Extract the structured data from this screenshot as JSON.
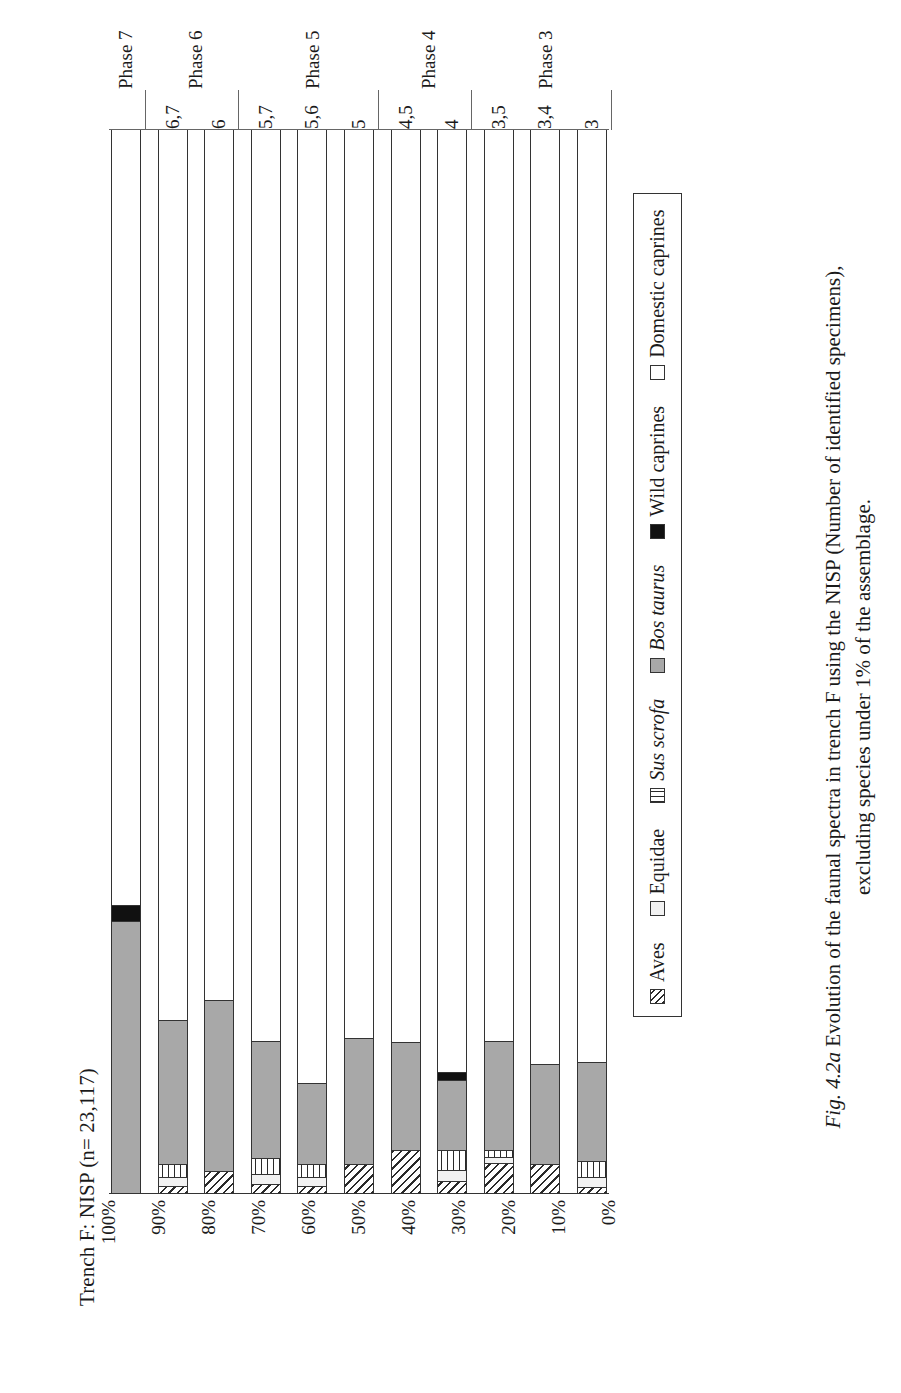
{
  "figure": {
    "caption_label": "Fig. 4.2a",
    "caption_line1": "Evolution of the faunal spectra in trench F using the NISP (Number of identified specimens),",
    "caption_line2": "excluding species under 1% of the assemblage."
  },
  "chart_data": {
    "type": "bar",
    "orientation": "stacked-100-rotated",
    "title": "Trench F: NISP (n= 23,117)",
    "xlabel": "",
    "ylabel": "",
    "ylim": [
      0,
      100
    ],
    "grid": false,
    "legend_position": "right-of-plot",
    "categories": [
      "3",
      "3,4",
      "3,5",
      "4",
      "4,5",
      "5",
      "5,6",
      "5,7",
      "6",
      "6,7",
      "Phase 7"
    ],
    "group_labels": [
      "Phase 3",
      "Phase 4",
      "Phase 5",
      "Phase 6",
      "Phase 7"
    ],
    "groups": [
      {
        "label": "Phase 3",
        "categories": [
          "3",
          "3,4",
          "3,5"
        ]
      },
      {
        "label": "Phase 4",
        "categories": [
          "4",
          "4,5"
        ]
      },
      {
        "label": "Phase 5",
        "categories": [
          "5",
          "5,6",
          "5,7"
        ]
      },
      {
        "label": "Phase 6",
        "categories": [
          "6",
          "6,7"
        ]
      },
      {
        "label": "Phase 7",
        "categories": [
          "Phase 7"
        ]
      }
    ],
    "tick_labels": [
      "100%",
      "90%",
      "80%",
      "70%",
      "60%",
      "50%",
      "40%",
      "30%",
      "20%",
      "10%",
      "0%"
    ],
    "series": [
      {
        "name": "Aves",
        "color": "#ffffff",
        "pattern": "diagonal-hatch",
        "values": [
          0.5,
          2.6,
          2.7,
          1.0,
          4.0,
          2.6,
          0.6,
          0.8,
          2.0,
          0.6,
          0.0
        ]
      },
      {
        "name": "Equidae",
        "color": "#f2f2f2",
        "pattern": "solid-light",
        "values": [
          0.8,
          0.0,
          0.5,
          1.0,
          0.0,
          0.0,
          0.7,
          0.8,
          0.0,
          0.7,
          0.0
        ]
      },
      {
        "name": "Sus scrofa",
        "color": "#ffffff",
        "pattern": "vertical-stripe",
        "values": [
          1.4,
          0.0,
          0.6,
          1.8,
          0.0,
          0.0,
          1.2,
          1.4,
          0.0,
          1.2,
          0.0
        ]
      },
      {
        "name": "Bos taurus",
        "color": "#a8a8a8",
        "pattern": "solid-gray",
        "values": [
          9.3,
          9.4,
          10.2,
          6.5,
          10.0,
          11.8,
          7.5,
          11.0,
          16.0,
          13.5,
          25.5
        ]
      },
      {
        "name": "Wild caprines",
        "color": "#111111",
        "pattern": "solid-black",
        "values": [
          0.0,
          0.0,
          0.0,
          0.7,
          0.0,
          0.0,
          0.0,
          0.0,
          0.0,
          0.0,
          1.5
        ]
      },
      {
        "name": "Domestic caprines",
        "color": "#ffffff",
        "pattern": "solid-white",
        "values": [
          88.0,
          88.0,
          86.0,
          89.0,
          86.0,
          85.6,
          90.0,
          86.0,
          82.0,
          84.0,
          73.0
        ]
      }
    ]
  }
}
